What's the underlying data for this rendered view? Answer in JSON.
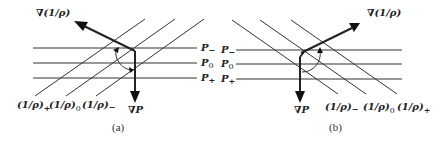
{
  "figure": {
    "panels": [
      {
        "id": "a",
        "caption": "(a)",
        "isobars": [
          "P−",
          "P0",
          "P+"
        ],
        "isosteres": [
          "(1/ρ)+",
          "(1/ρ)0",
          "(1/ρ)−"
        ],
        "gradient_specific_volume_label": "∇(1/ρ)",
        "gradient_pressure_label": "∇P",
        "isostere_orientation": "rising to the right"
      },
      {
        "id": "b",
        "caption": "(b)",
        "isobars": [
          "P−",
          "P0",
          "P+"
        ],
        "isosteres": [
          "(1/ρ)−",
          "(1/ρ)0",
          "(1/ρ)+"
        ],
        "gradient_specific_volume_label": "∇(1/ρ)",
        "gradient_pressure_label": "∇P",
        "isostere_orientation": "falling to the right"
      }
    ]
  },
  "labels": {
    "a": {
      "grad_v": "∇(1/ρ)",
      "grad_p": "∇P",
      "p_minus": "P",
      "p_minus_sub": "−",
      "p_zero": "P",
      "p_zero_sub": "0",
      "p_plus": "P",
      "p_plus_sub": "+",
      "v1": "(1/ρ)",
      "v1_sub": "+",
      "v2": "(1/ρ)",
      "v2_sub": "0",
      "v3": "(1/ρ)",
      "v3_sub": "−",
      "caption": "(a)"
    },
    "b": {
      "grad_v": "∇(1/ρ)",
      "grad_p": "∇P",
      "p_minus": "P",
      "p_minus_sub": "−",
      "p_zero": "P",
      "p_zero_sub": "0",
      "p_plus": "P",
      "p_plus_sub": "+",
      "v1": "(1/ρ)",
      "v1_sub": "−",
      "v2": "(1/ρ)",
      "v2_sub": "0",
      "v3": "(1/ρ)",
      "v3_sub": "+",
      "caption": "(b)"
    }
  }
}
